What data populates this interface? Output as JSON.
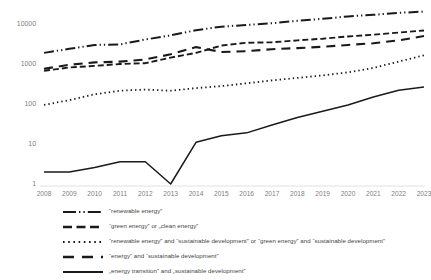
{
  "chart_data": {
    "type": "line",
    "title": "",
    "xlabel": "",
    "ylabel": "",
    "yscale": "log",
    "ylim": [
      1,
      20000
    ],
    "y_ticks": [
      "1",
      "10",
      "100",
      "1000",
      "10000"
    ],
    "y_tick_values": [
      1,
      10,
      100,
      1000,
      10000
    ],
    "grid": false,
    "legend_position": "bottom",
    "categories": [
      "2008",
      "2009",
      "2010",
      "2011",
      "2012",
      "2013",
      "2014",
      "2015",
      "2016",
      "2017",
      "2018",
      "2019",
      "2020",
      "2021",
      "2022",
      "2023"
    ],
    "series": [
      {
        "name": "“renewable energy”",
        "style": "dash-dot-dot",
        "values": [
          1900,
          2400,
          3000,
          3100,
          4100,
          5200,
          7000,
          8600,
          9500,
          10500,
          12000,
          13500,
          15500,
          17000,
          19000,
          20500
        ]
      },
      {
        "name": "“green energy” or „clean energy”",
        "style": "dashed",
        "values": [
          680,
          820,
          900,
          1000,
          1050,
          1450,
          1900,
          2900,
          3400,
          3500,
          3900,
          4300,
          4900,
          5400,
          6100,
          6900
        ]
      },
      {
        "name": "“renewable energy” and “sustainable development” or “green energy” and “sustainable development”",
        "style": "dotted",
        "values": [
          95,
          125,
          175,
          215,
          230,
          215,
          250,
          280,
          330,
          390,
          450,
          520,
          620,
          800,
          1150,
          1650
        ]
      },
      {
        "name": "“energy” and “sustainable development”",
        "style": "long-dash",
        "values": [
          760,
          960,
          1100,
          1150,
          1300,
          1750,
          2650,
          2000,
          2100,
          2350,
          2500,
          2700,
          3000,
          3300,
          3900,
          5000
        ]
      },
      {
        "name": "„energy transition” and „sustainable development”",
        "style": "solid",
        "values": [
          2.0,
          2.0,
          2.6,
          3.6,
          3.6,
          1.0,
          11,
          16,
          19,
          30,
          46,
          66,
          95,
          150,
          220,
          265
        ]
      }
    ]
  },
  "colors": {
    "line": "#1a1a1a",
    "tick_text": "#808080",
    "legend_text": "#3f3f3f",
    "background": "#ffffff"
  }
}
